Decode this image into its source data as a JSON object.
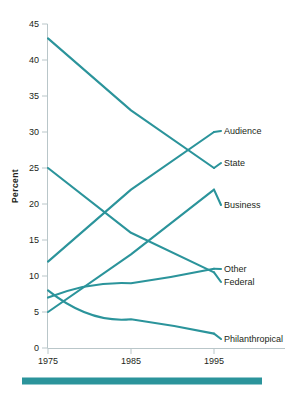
{
  "chart_data": {
    "type": "line",
    "title": "",
    "subtitle": "",
    "xlabel": "",
    "ylabel": "Percent",
    "x": [
      1975,
      1985,
      1995
    ],
    "categories": [
      "1975",
      "1985",
      "1995"
    ],
    "xlim": [
      1975,
      1995
    ],
    "ylim": [
      0,
      45
    ],
    "yticks": [
      0,
      5,
      10,
      15,
      20,
      25,
      30,
      35,
      40,
      45
    ],
    "ytick_labels": [
      "0",
      "5",
      "10",
      "15",
      "20",
      "25",
      "30",
      "35",
      "40",
      "45"
    ],
    "xticks": [
      1975,
      1985,
      1995
    ],
    "xtick_labels": [
      "1975",
      "1985",
      "1995"
    ],
    "grid": false,
    "legend_position": "right-inline-labels",
    "line_color": "#2b949b",
    "series": [
      {
        "name": "State",
        "label": "State",
        "values": [
          43,
          33,
          25
        ]
      },
      {
        "name": "Audience",
        "label": "Audience",
        "values": [
          12,
          22,
          30
        ]
      },
      {
        "name": "Business",
        "label": "Business",
        "values": [
          5,
          13,
          22
        ]
      },
      {
        "name": "Federal",
        "label": "Federal",
        "values": [
          25,
          16,
          10.5
        ]
      },
      {
        "name": "Other",
        "label": "Other",
        "values": [
          7,
          9,
          11
        ]
      },
      {
        "name": "Philanthropical",
        "label": "Philanthropical",
        "values": [
          8,
          4,
          2
        ]
      }
    ]
  },
  "axes": {
    "y_title": "Percent",
    "y_tick_labels": [
      "45",
      "40",
      "35",
      "30",
      "25",
      "20",
      "15",
      "10",
      "5",
      "0"
    ],
    "x_tick_labels": [
      "1975",
      "1985",
      "1995"
    ]
  },
  "series_labels": [
    {
      "name": "Audience",
      "text": "Audience"
    },
    {
      "name": "State",
      "text": "State"
    },
    {
      "name": "Business",
      "text": "Business"
    },
    {
      "name": "Other",
      "text": "Other"
    },
    {
      "name": "Federal",
      "text": "Federal"
    },
    {
      "name": "Philanthropical",
      "text": "Philanthropical"
    }
  ],
  "decor": {
    "rule_color": "#2b949b"
  }
}
